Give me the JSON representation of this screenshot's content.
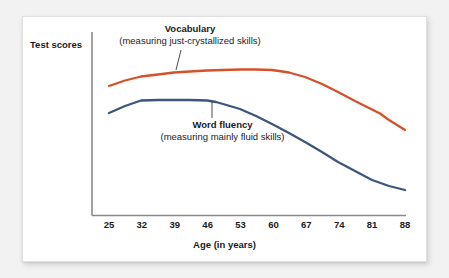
{
  "figure": {
    "background_color": "#f2f2f2",
    "card_color": "#ffffff"
  },
  "chart_data": {
    "type": "line",
    "title": "",
    "xlabel": "Age (in years)",
    "ylabel": "Test scores",
    "x": [
      25,
      32,
      39,
      46,
      53,
      60,
      67,
      74,
      81,
      88
    ],
    "xticklabels": [
      "25",
      "32",
      "39",
      "46",
      "53",
      "60",
      "67",
      "74",
      "81",
      "88"
    ],
    "xlim": [
      25,
      88
    ],
    "ylim": [
      0,
      100
    ],
    "yticklabels": [],
    "grid": false,
    "legend": "inline-annotations",
    "series": [
      {
        "name": "Vocabulary",
        "sublabel": "(measuring just-crystallized skills)",
        "color": "#d4512a",
        "values": [
          62,
          70,
          73,
          75,
          76,
          76,
          72,
          66,
          60,
          44
        ]
      },
      {
        "name": "Word fluency",
        "sublabel": "(measuring mainly fluid skills)",
        "color": "#3e567c",
        "values": [
          48,
          54,
          54,
          54,
          52,
          46,
          38,
          29,
          21,
          14
        ]
      }
    ],
    "annotations": [
      {
        "text": "Vocabulary",
        "subtext": "(measuring just-crystallized skills)",
        "points_to_series": "Vocabulary",
        "points_to_x": 42
      },
      {
        "text": "Word fluency",
        "subtext": "(measuring mainly fluid skills)",
        "points_to_series": "Word fluency",
        "points_to_x": 50
      }
    ]
  },
  "axis": {
    "y_title": "Test scores",
    "x_title": "Age (in years)",
    "ticks": [
      {
        "label": "25"
      },
      {
        "label": "32"
      },
      {
        "label": "39"
      },
      {
        "label": "46"
      },
      {
        "label": "53"
      },
      {
        "label": "60"
      },
      {
        "label": "67"
      },
      {
        "label": "74"
      },
      {
        "label": "81"
      },
      {
        "label": "88"
      }
    ]
  },
  "labels": {
    "vocabulary": {
      "name": "Vocabulary",
      "sub": "(measuring just-crystallized skills)"
    },
    "word_fluency": {
      "name": "Word fluency",
      "sub": "(measuring mainly fluid skills)"
    }
  }
}
